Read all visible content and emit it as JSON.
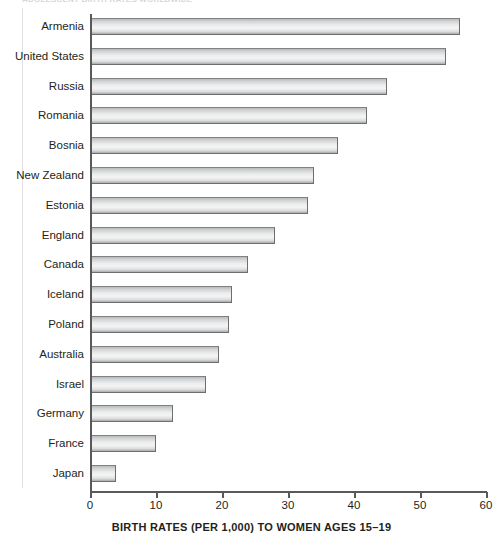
{
  "top_caption": "ADOLESCENT BIRTH RATES WORLDWIDE",
  "chart_data": {
    "type": "bar",
    "orientation": "horizontal",
    "title": "",
    "xlabel": "BIRTH RATES (PER 1,000) TO WOMEN AGES 15–19",
    "ylabel": "",
    "xlim": [
      0,
      60
    ],
    "xticks": [
      0,
      10,
      20,
      30,
      40,
      50,
      60
    ],
    "xtick_labels": [
      "0",
      "10",
      "20",
      "30",
      "40",
      "50",
      "60"
    ],
    "grid": false,
    "legend": null,
    "categories": [
      "Armenia",
      "United States",
      "Russia",
      "Romania",
      "Bosnia",
      "New Zealand",
      "Estonia",
      "England",
      "Canada",
      "Iceland",
      "Poland",
      "Australia",
      "Israel",
      "Germany",
      "France",
      "Japan"
    ],
    "values": [
      56,
      54,
      45,
      42,
      37.5,
      34,
      33,
      28,
      24,
      21.5,
      21,
      19.5,
      17.5,
      12.5,
      10,
      4
    ],
    "bar_fill_light": "#f4f4f4",
    "bar_fill_dark": "#b9babc",
    "bar_border_color": "#6d6e70",
    "axis_color": "#58595b",
    "text_color": "#231f20"
  }
}
